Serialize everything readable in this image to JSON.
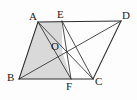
{
  "figure": {
    "background_color": "#fdfdfd",
    "shade_color": "#d6d6d6",
    "line_color": "#3a3a3a",
    "label_color": "#1b1b1b",
    "width": 137,
    "height": 100
  },
  "points": {
    "A": {
      "label": "A",
      "x": 38,
      "y": 22,
      "label_x": 29,
      "label_y": 20
    },
    "E": {
      "label": "E",
      "x": 62,
      "y": 21,
      "label_x": 57,
      "label_y": 18
    },
    "D": {
      "label": "D",
      "x": 121,
      "y": 21,
      "label_x": 122,
      "label_y": 19
    },
    "B": {
      "label": "B",
      "x": 19,
      "y": 79,
      "label_x": 7,
      "label_y": 81
    },
    "F": {
      "label": "F",
      "x": 71,
      "y": 79,
      "label_x": 66,
      "label_y": 90
    },
    "C": {
      "label": "C",
      "x": 93,
      "y": 79,
      "label_x": 95,
      "label_y": 85
    },
    "O": {
      "label": "O",
      "x": 62,
      "y": 51,
      "label_x": 51,
      "label_y": 50
    }
  },
  "segments": [
    {
      "name": "AD",
      "from": "A",
      "to": "D",
      "kind": "outline"
    },
    {
      "name": "DC",
      "from": "D",
      "to": "C",
      "kind": "outline"
    },
    {
      "name": "CB",
      "from": "C",
      "to": "B",
      "kind": "outline"
    },
    {
      "name": "BA",
      "from": "B",
      "to": "A",
      "kind": "outline"
    },
    {
      "name": "BD",
      "from": "B",
      "to": "D",
      "kind": "edge"
    },
    {
      "name": "AC",
      "from": "A",
      "to": "C",
      "kind": "edge"
    },
    {
      "name": "EF",
      "from": "E",
      "to": "F",
      "kind": "edge"
    },
    {
      "name": "EC",
      "from": "E",
      "to": "C",
      "kind": "edge"
    },
    {
      "name": "AF",
      "from": "A",
      "to": "F",
      "kind": "edge"
    }
  ],
  "shaded_polygon": {
    "name": "pentagon-AEOFB",
    "vertices": [
      "A",
      "E",
      "O",
      "F",
      "B"
    ]
  }
}
